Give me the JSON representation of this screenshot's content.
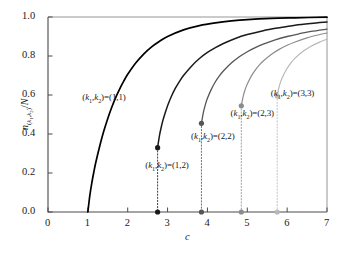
{
  "chart_data": {
    "type": "line",
    "title": "",
    "xlabel": "c",
    "ylabel": "n(k1,k2)/N",
    "xlim": [
      0,
      7
    ],
    "ylim": [
      0.0,
      1.0
    ],
    "xticks": [
      "0",
      "1",
      "2",
      "3",
      "4",
      "5",
      "6",
      "7"
    ],
    "xtick_values": [
      0,
      1,
      2,
      3,
      4,
      5,
      6,
      7
    ],
    "yticks": [
      "0.0",
      "0.2",
      "0.4",
      "0.6",
      "0.8",
      "1.0"
    ],
    "ytick_values": [
      0.0,
      0.2,
      0.4,
      0.6,
      0.8,
      1.0
    ],
    "grid": false,
    "legend": "inline-annotations",
    "series": [
      {
        "name": "(k1,k2)=(1,1)",
        "label": "(k₁,k₂)=(1,1)",
        "color": "#000000",
        "width": 1.7,
        "onset_c": 1.0,
        "onset_value": 0.0,
        "has_endpoint_dot": false,
        "has_droplines": false,
        "points": [
          [
            1.0,
            0.0
          ],
          [
            1.05,
            0.085
          ],
          [
            1.1,
            0.15
          ],
          [
            1.15,
            0.205
          ],
          [
            1.2,
            0.255
          ],
          [
            1.3,
            0.34
          ],
          [
            1.4,
            0.415
          ],
          [
            1.5,
            0.48
          ],
          [
            1.6,
            0.537
          ],
          [
            1.7,
            0.588
          ],
          [
            1.8,
            0.632
          ],
          [
            1.9,
            0.671
          ],
          [
            2.0,
            0.706
          ],
          [
            2.2,
            0.764
          ],
          [
            2.4,
            0.81
          ],
          [
            2.6,
            0.847
          ],
          [
            2.8,
            0.876
          ],
          [
            3.0,
            0.9
          ],
          [
            3.4,
            0.934
          ],
          [
            3.8,
            0.956
          ],
          [
            4.2,
            0.97
          ],
          [
            4.6,
            0.98
          ],
          [
            5.0,
            0.987
          ],
          [
            5.6,
            0.993
          ],
          [
            6.2,
            0.996
          ],
          [
            7.0,
            0.999
          ]
        ]
      },
      {
        "name": "(k1,k2)=(1,2)",
        "label": "(k₁,k₂)=(1,2)",
        "color": "#1a1a1a",
        "width": 1.5,
        "onset_c": 2.75,
        "onset_value": 0.33,
        "has_endpoint_dot": true,
        "has_droplines": true,
        "points": [
          [
            2.75,
            0.33
          ],
          [
            2.8,
            0.395
          ],
          [
            2.85,
            0.443
          ],
          [
            2.9,
            0.482
          ],
          [
            3.0,
            0.545
          ],
          [
            3.1,
            0.595
          ],
          [
            3.2,
            0.636
          ],
          [
            3.3,
            0.67
          ],
          [
            3.4,
            0.7
          ],
          [
            3.6,
            0.748
          ],
          [
            3.8,
            0.787
          ],
          [
            4.0,
            0.818
          ],
          [
            4.2,
            0.843
          ],
          [
            4.4,
            0.864
          ],
          [
            4.7,
            0.89
          ],
          [
            5.0,
            0.91
          ],
          [
            5.4,
            0.93
          ],
          [
            5.8,
            0.945
          ],
          [
            6.2,
            0.958
          ],
          [
            6.6,
            0.967
          ],
          [
            7.0,
            0.974
          ]
        ]
      },
      {
        "name": "(k1,k2)=(2,2)",
        "label": "(k₁,k₂)=(2,2)",
        "color": "#555555",
        "width": 1.3,
        "onset_c": 3.85,
        "onset_value": 0.455,
        "has_endpoint_dot": true,
        "has_droplines": true,
        "points": [
          [
            3.85,
            0.455
          ],
          [
            3.9,
            0.512
          ],
          [
            3.95,
            0.552
          ],
          [
            4.0,
            0.583
          ],
          [
            4.1,
            0.63
          ],
          [
            4.2,
            0.668
          ],
          [
            4.3,
            0.698
          ],
          [
            4.4,
            0.723
          ],
          [
            4.6,
            0.764
          ],
          [
            4.8,
            0.796
          ],
          [
            5.0,
            0.822
          ],
          [
            5.2,
            0.843
          ],
          [
            5.4,
            0.861
          ],
          [
            5.7,
            0.883
          ],
          [
            6.0,
            0.9
          ],
          [
            6.3,
            0.914
          ],
          [
            6.6,
            0.926
          ],
          [
            7.0,
            0.938
          ]
        ]
      },
      {
        "name": "(k1,k2)=(2,3)",
        "label": "(k₁,k₂)=(2,3)",
        "color": "#8c8c8c",
        "width": 1.2,
        "onset_c": 4.85,
        "onset_value": 0.545,
        "has_endpoint_dot": true,
        "has_droplines": true,
        "points": [
          [
            4.85,
            0.545
          ],
          [
            4.9,
            0.596
          ],
          [
            4.95,
            0.63
          ],
          [
            5.0,
            0.656
          ],
          [
            5.1,
            0.697
          ],
          [
            5.2,
            0.728
          ],
          [
            5.3,
            0.753
          ],
          [
            5.4,
            0.774
          ],
          [
            5.6,
            0.808
          ],
          [
            5.8,
            0.834
          ],
          [
            6.0,
            0.855
          ],
          [
            6.2,
            0.872
          ],
          [
            6.5,
            0.893
          ],
          [
            6.8,
            0.909
          ],
          [
            7.0,
            0.918
          ]
        ]
      },
      {
        "name": "(k1,k2)=(3,3)",
        "label": "(k₁,k₂)=(3,3)",
        "color": "#b8b8b8",
        "width": 1.2,
        "onset_c": 5.75,
        "onset_value": 0.595,
        "has_endpoint_dot": true,
        "has_droplines": true,
        "points": [
          [
            5.75,
            0.595
          ],
          [
            5.8,
            0.643
          ],
          [
            5.85,
            0.675
          ],
          [
            5.9,
            0.699
          ],
          [
            6.0,
            0.737
          ],
          [
            6.1,
            0.766
          ],
          [
            6.2,
            0.789
          ],
          [
            6.4,
            0.824
          ],
          [
            6.6,
            0.85
          ],
          [
            6.8,
            0.87
          ],
          [
            7.0,
            0.886
          ]
        ]
      }
    ],
    "annotations": [
      {
        "text": "(k₁,k₂)=(1,1)",
        "c": 1.4,
        "value": 0.585,
        "anchor": "middle"
      },
      {
        "text": "(k₁,k₂)=(1,2)",
        "c": 2.98,
        "value": 0.235,
        "anchor": "middle"
      },
      {
        "text": "(k₁,k₂)=(2,2)",
        "c": 4.13,
        "value": 0.385,
        "anchor": "middle"
      },
      {
        "text": "(k₁,k₂)=(2,3)",
        "c": 5.12,
        "value": 0.505,
        "anchor": "middle"
      },
      {
        "text": "(k₁,k₂)=(3,3)",
        "c": 6.13,
        "value": 0.605,
        "anchor": "middle"
      }
    ]
  }
}
